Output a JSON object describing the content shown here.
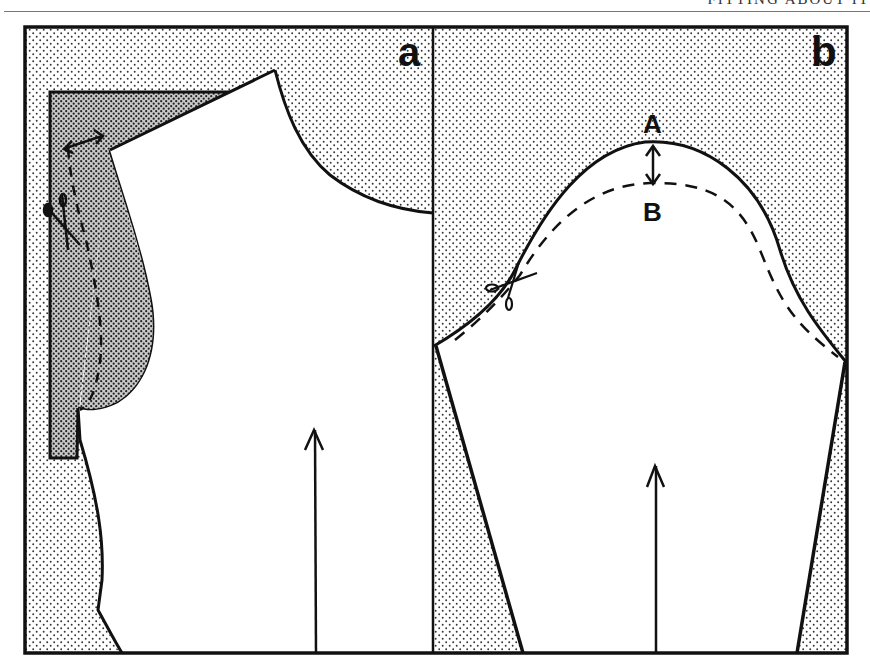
{
  "running_head": {
    "text": "FITTING ABOUT IT"
  },
  "panels": [
    {
      "id": "a",
      "label": "a",
      "description": "Bodice pattern piece with shaded area showing armhole alteration (dashed new cutting line, scissors, double arrow at shoulder)",
      "grainline": "vertical arrow"
    },
    {
      "id": "b",
      "label": "b",
      "description": "Sleeve pattern piece; sleeve cap lowered from A to B (dashed line), scissors along cap",
      "points": {
        "top": "A",
        "lowered": "B"
      },
      "grainline": "vertical arrow"
    }
  ],
  "colors": {
    "ink": "#111111",
    "paper": "#ffffff",
    "dot_light": "#333333",
    "dot_dense": "#222222"
  }
}
